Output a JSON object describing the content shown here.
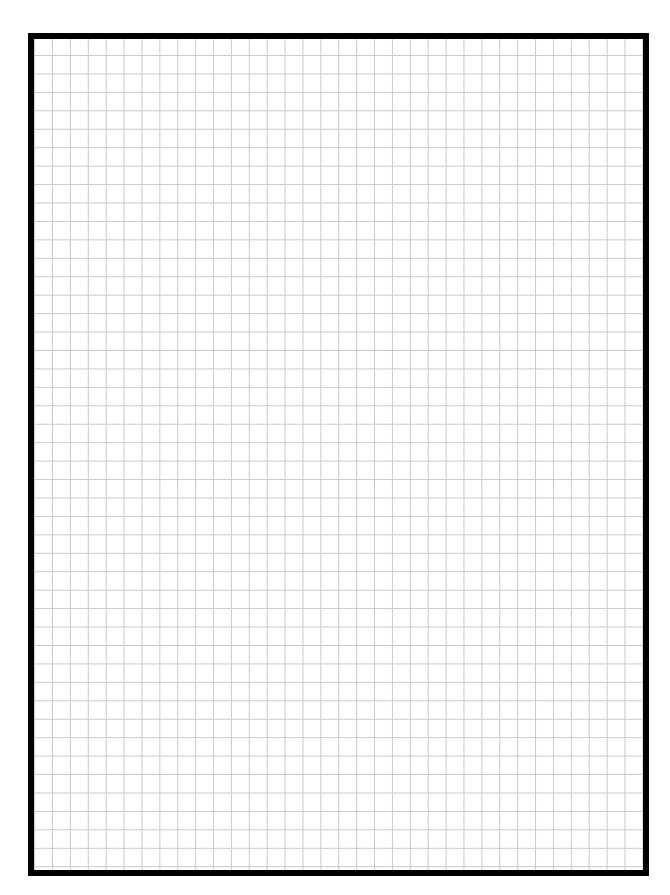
{
  "page": {
    "type": "graph-paper",
    "grid": {
      "columns": 34,
      "rows": 45,
      "line_color": "#c9c9c9",
      "cell_width_px": 17.9,
      "cell_height_px": 18.45
    },
    "border": {
      "color": "#000000",
      "thickness_px": 6
    },
    "background_color": "#ffffff"
  }
}
